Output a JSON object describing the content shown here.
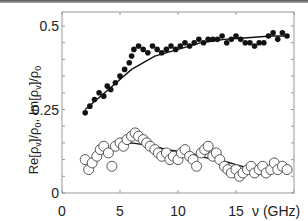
{
  "chart_data": {
    "type": "scatter",
    "title": "",
    "xlabel": "ν (GHz)",
    "ylabel": "Re[ρv]/ρ0, Im[ρv]/ρ0",
    "xlim": [
      0,
      20
    ],
    "ylim": [
      0,
      0.55
    ],
    "x_ticks": [
      "0",
      "5",
      "10",
      "15"
    ],
    "y_ticks": [
      "0",
      "0.25",
      "0.5"
    ],
    "grid": false,
    "series": [
      {
        "name": "Re[ρv]/ρ0 (data, filled)",
        "marker": "filled-circle",
        "x": [
          2.0,
          2.4,
          2.8,
          3.2,
          3.6,
          3.9,
          4.2,
          4.6,
          5.0,
          5.4,
          5.8,
          6.0,
          6.2,
          6.6,
          7.0,
          7.4,
          7.8,
          8.2,
          8.6,
          9.0,
          9.4,
          9.8,
          10.2,
          10.6,
          11.0,
          11.4,
          11.8,
          12.2,
          12.6,
          13.0,
          13.4,
          13.8,
          14.2,
          14.6,
          15.0,
          15.4,
          15.8,
          16.2,
          16.6,
          17.0,
          17.4,
          17.8,
          18.2,
          18.6,
          19.0,
          19.4
        ],
        "y": [
          0.24,
          0.26,
          0.28,
          0.3,
          0.29,
          0.32,
          0.31,
          0.33,
          0.35,
          0.37,
          0.39,
          0.41,
          0.43,
          0.44,
          0.43,
          0.42,
          0.44,
          0.43,
          0.42,
          0.43,
          0.44,
          0.43,
          0.44,
          0.45,
          0.44,
          0.45,
          0.46,
          0.45,
          0.46,
          0.46,
          0.46,
          0.47,
          0.45,
          0.46,
          0.47,
          0.46,
          0.45,
          0.45,
          0.44,
          0.45,
          0.45,
          0.47,
          0.48,
          0.46,
          0.48,
          0.47
        ]
      },
      {
        "name": "Re fit (line)",
        "marker": "line",
        "x": [
          2,
          4,
          6,
          8,
          10,
          12,
          14,
          16,
          18,
          19.5
        ],
        "y": [
          0.25,
          0.31,
          0.37,
          0.41,
          0.43,
          0.45,
          0.46,
          0.465,
          0.47,
          0.47
        ]
      },
      {
        "name": "Im[ρv]/ρ0 (data, open)",
        "marker": "open-circle",
        "x": [
          2.0,
          2.3,
          2.6,
          3.0,
          3.3,
          3.6,
          4.0,
          4.3,
          4.6,
          5.0,
          5.3,
          5.6,
          6.0,
          6.3,
          6.6,
          7.0,
          7.3,
          7.6,
          8.0,
          8.3,
          8.6,
          9.0,
          9.3,
          9.6,
          10.0,
          10.3,
          10.6,
          11.0,
          11.3,
          11.6,
          12.0,
          12.3,
          12.6,
          13.0,
          13.3,
          13.6,
          14.0,
          14.3,
          14.6,
          15.0,
          15.3,
          15.6,
          16.0,
          16.3,
          16.6,
          17.0,
          17.3,
          17.6,
          18.0,
          18.3,
          18.6,
          19.0,
          19.4
        ],
        "y": [
          0.1,
          0.07,
          0.09,
          0.11,
          0.13,
          0.14,
          0.12,
          0.08,
          0.14,
          0.15,
          0.14,
          0.16,
          0.17,
          0.18,
          0.17,
          0.16,
          0.15,
          0.14,
          0.13,
          0.12,
          0.11,
          0.12,
          0.1,
          0.11,
          0.1,
          0.12,
          0.13,
          0.11,
          0.1,
          0.08,
          0.12,
          0.13,
          0.14,
          0.11,
          0.12,
          0.1,
          0.08,
          0.07,
          0.06,
          0.07,
          0.05,
          0.06,
          0.07,
          0.08,
          0.06,
          0.07,
          0.08,
          0.06,
          0.07,
          0.09,
          0.07,
          0.08,
          0.07
        ]
      },
      {
        "name": "Im fit (line)",
        "marker": "line",
        "x": [
          2,
          3,
          4,
          5,
          6,
          7,
          8,
          9,
          10,
          11,
          12,
          13,
          14,
          15,
          16,
          17,
          18,
          19.5
        ],
        "y": [
          0.09,
          0.11,
          0.13,
          0.14,
          0.15,
          0.145,
          0.14,
          0.13,
          0.125,
          0.12,
          0.11,
          0.1,
          0.095,
          0.085,
          0.075,
          0.07,
          0.07,
          0.07
        ]
      }
    ]
  }
}
